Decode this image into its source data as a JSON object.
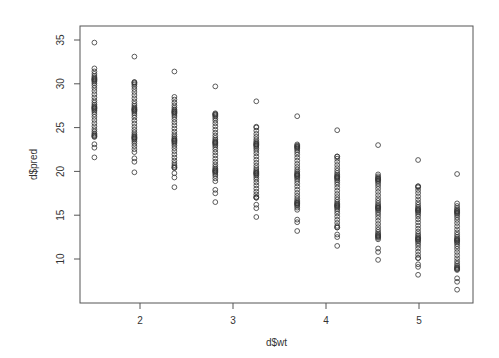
{
  "chart_data": {
    "type": "scatter",
    "title": "",
    "xlabel": "d$wt",
    "ylabel": "d$pred",
    "xlim": [
      1.36,
      5.6
    ],
    "ylim": [
      5.2,
      36.6
    ],
    "x_ticks": [
      2,
      3,
      4,
      5
    ],
    "y_ticks": [
      10,
      15,
      20,
      25,
      30,
      35
    ],
    "grid": false,
    "legend": null,
    "marker": "open-circle",
    "marker_color": "#333333",
    "columns": [
      {
        "x": 1.51,
        "top": 34.7,
        "band": [
          31.9,
          23.8
        ],
        "lower": [
          23.1,
          22.7
        ],
        "bottom": 21.6
      },
      {
        "x": 1.94,
        "top": 33.1,
        "band": [
          30.2,
          22.2
        ],
        "lower": [
          21.5,
          21.1
        ],
        "bottom": 19.9
      },
      {
        "x": 2.37,
        "top": 31.4,
        "band": [
          28.5,
          20.4
        ],
        "lower": [
          19.8,
          19.3
        ],
        "bottom": 18.2
      },
      {
        "x": 2.81,
        "top": 29.7,
        "band": [
          26.8,
          18.7
        ],
        "lower": [
          17.9,
          17.5
        ],
        "bottom": 16.5
      },
      {
        "x": 3.25,
        "top": 28.0,
        "band": [
          25.1,
          17.0
        ],
        "lower": [
          16.2,
          15.8
        ],
        "bottom": 14.8
      },
      {
        "x": 3.69,
        "top": 26.3,
        "band": [
          23.4,
          15.3
        ],
        "lower": [
          14.5,
          14.2
        ],
        "bottom": 13.2
      },
      {
        "x": 4.12,
        "top": 24.7,
        "band": [
          21.7,
          13.6
        ],
        "lower": [
          12.8,
          12.5
        ],
        "bottom": 11.5
      },
      {
        "x": 4.56,
        "top": 23.0,
        "band": [
          20.0,
          11.9
        ],
        "lower": [
          11.2,
          10.8
        ],
        "bottom": 9.9
      },
      {
        "x": 4.99,
        "top": 21.3,
        "band": [
          18.3,
          10.1
        ],
        "lower": [
          9.4,
          9.1
        ],
        "bottom": 8.2
      },
      {
        "x": 5.41,
        "top": 19.7,
        "band": [
          16.6,
          8.5
        ],
        "lower": [
          7.8,
          7.4
        ],
        "bottom": 6.5
      }
    ],
    "band_points_per_column": 38
  },
  "plot_area": {
    "left": 80,
    "top": 26,
    "right": 473,
    "bottom": 303
  },
  "axis_pixels": {
    "x2": 140,
    "x3": 233,
    "y35": 40,
    "y10": 259
  }
}
